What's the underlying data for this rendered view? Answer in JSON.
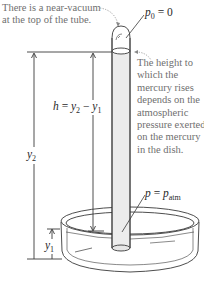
{
  "callouts": {
    "vacuum": {
      "lines": [
        "There is a near-vacuum",
        "at the top of the tube."
      ]
    },
    "height": {
      "lines": [
        "The height to",
        "which the",
        "mercury rises",
        "depends on the",
        "atmospheric",
        "pressure exerted",
        "on the mercury",
        "in the dish."
      ]
    }
  },
  "labels": {
    "p0": {
      "var": "p",
      "sub": "0",
      "rest": " = 0"
    },
    "p_atm": {
      "var": "p",
      "eq": " = ",
      "var2": "p",
      "sub": "atm"
    },
    "h": {
      "var": "h",
      "eq": " = ",
      "y2": "y",
      "y2sub": "2",
      "minus": " − ",
      "y1": "y",
      "y1sub": "1"
    },
    "y2": {
      "var": "y",
      "sub": "2"
    },
    "y1": {
      "var": "y",
      "sub": "1"
    }
  },
  "colors": {
    "line": "#3a3a3a",
    "text_gray": "#6f6f6f",
    "callout_dots": "#888888",
    "tube_fill": "#f4f4f4",
    "mercury_fill": "#e9e9e9"
  }
}
